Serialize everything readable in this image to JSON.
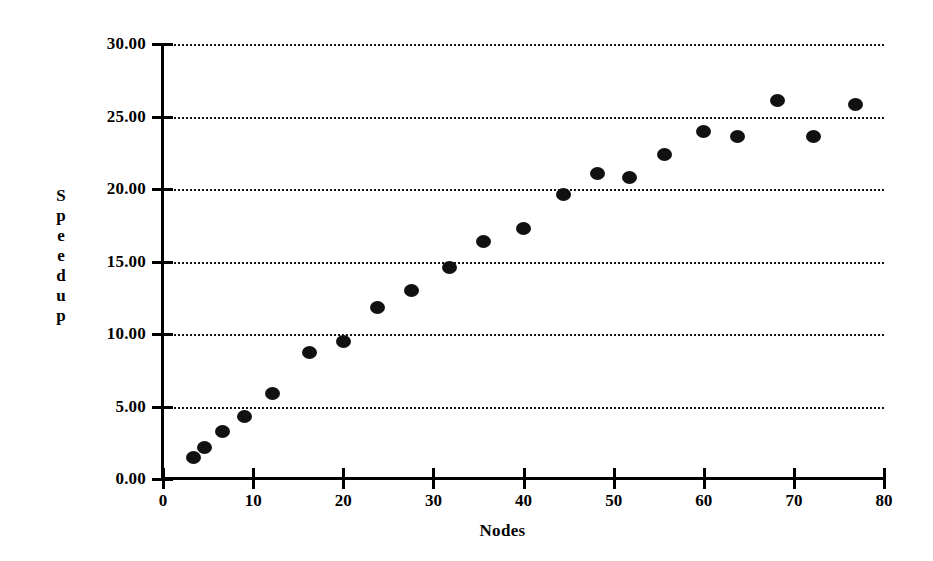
{
  "chart_data": {
    "type": "scatter",
    "title": "",
    "xlabel": "Nodes",
    "ylabel": "Speedup",
    "ylabel_letters": [
      "S",
      "p",
      "e",
      "e",
      "d",
      "u",
      "p"
    ],
    "xlim": [
      0,
      80
    ],
    "ylim": [
      0,
      30
    ],
    "xticks": [
      0,
      10,
      20,
      30,
      40,
      50,
      60,
      70,
      80
    ],
    "xticklabels": [
      "0",
      "10",
      "20",
      "30",
      "40",
      "50",
      "60",
      "70",
      "80"
    ],
    "yticks": [
      0,
      5,
      10,
      15,
      20,
      25,
      30
    ],
    "yticklabels": [
      "0.00",
      "5.00",
      "10.00",
      "15.00",
      "20.00",
      "25.00",
      "30.00"
    ],
    "grid": {
      "horizontal": true,
      "vertical": false,
      "style": "dotted",
      "color": "#111111"
    },
    "legend": null,
    "marker": {
      "shape": "circle",
      "color": "#111111",
      "size": 14
    },
    "series": [
      {
        "name": "Speedup",
        "points": [
          {
            "x": 3.4,
            "y": 1.5
          },
          {
            "x": 4.6,
            "y": 2.2
          },
          {
            "x": 6.6,
            "y": 3.3
          },
          {
            "x": 9.0,
            "y": 4.3
          },
          {
            "x": 12.2,
            "y": 5.9
          },
          {
            "x": 16.2,
            "y": 8.7
          },
          {
            "x": 20.0,
            "y": 9.5
          },
          {
            "x": 23.8,
            "y": 11.8
          },
          {
            "x": 27.6,
            "y": 13.0
          },
          {
            "x": 31.8,
            "y": 14.6
          },
          {
            "x": 35.6,
            "y": 16.4
          },
          {
            "x": 40.0,
            "y": 17.3
          },
          {
            "x": 44.4,
            "y": 19.6
          },
          {
            "x": 48.2,
            "y": 21.1
          },
          {
            "x": 51.8,
            "y": 20.8
          },
          {
            "x": 55.6,
            "y": 22.4
          },
          {
            "x": 60.0,
            "y": 24.0
          },
          {
            "x": 63.8,
            "y": 23.6
          },
          {
            "x": 68.2,
            "y": 26.1
          },
          {
            "x": 72.2,
            "y": 23.6
          },
          {
            "x": 76.8,
            "y": 25.8
          }
        ]
      }
    ]
  }
}
